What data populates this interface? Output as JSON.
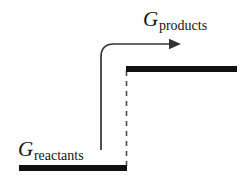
{
  "figure": {
    "background_color": "#ffffff",
    "width": 249,
    "height": 189
  },
  "labels": {
    "products": {
      "symbol": "G",
      "subscript": "products",
      "full_text": "Gproducts"
    },
    "reactants": {
      "symbol": "G",
      "subscript": "reactants",
      "full_text": "Greactants"
    }
  },
  "elements": {
    "reactants_level_bar": {
      "name": "reactants-energy-level",
      "color": "#111111",
      "x1": 19,
      "x2": 127,
      "y": 168,
      "thickness": 6
    },
    "products_level_bar": {
      "name": "products-energy-level",
      "color": "#111111",
      "x1": 126,
      "x2": 237,
      "y": 69,
      "thickness": 6
    },
    "dashed_connector": {
      "name": "energy-difference-dashed-line",
      "color": "#4a4a4a",
      "x": 126.5,
      "y1": 71,
      "y2": 167,
      "dash": "5 5"
    },
    "curved_arrow": {
      "name": "reaction-progress-arrow",
      "color": "#333333",
      "start_x": 101,
      "start_y": 150,
      "corner_y": 44,
      "tip_x": 181,
      "tip_y": 44,
      "corner_radius": 13
    }
  },
  "colors": {
    "ink": "#111111",
    "line": "#333333",
    "dashed": "#4a4a4a",
    "background": "#ffffff"
  }
}
